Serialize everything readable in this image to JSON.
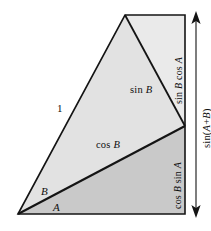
{
  "figure": {
    "name": "sine-addition-formula-geometric-proof",
    "width": 211,
    "height": 231,
    "background_color": "#ffffff",
    "stroke_color": "#141414",
    "colors": {
      "upper_triangle_fill": "#e2e2e2",
      "top_right_triangle_fill": "#eaeaea",
      "lower_region_fill": "#c9c9c9",
      "outline": "#141414",
      "arrow": "#141414",
      "text": "#0f0f0f"
    },
    "vertices": {
      "bottom_left": [
        18,
        214
      ],
      "apex": [
        125,
        15
      ],
      "top_right": [
        185,
        15
      ],
      "right_mid": [
        185,
        126
      ],
      "bottom_right": [
        185,
        214
      ]
    },
    "labels": {
      "hypotenuse": "1",
      "angle_upper": "B",
      "angle_lower": "A",
      "sin_b": "sin B",
      "cos_b": "cos B",
      "sin_b_cos_a": "sin B cos A",
      "cos_b_sin_a": "cos B sin A",
      "total_height": "sin(A+B)"
    },
    "label_parts": {
      "sin_b_fn": "sin",
      "sin_b_var": "B",
      "cos_b_fn": "cos",
      "cos_b_var": "B",
      "sin_b_cos_a_fn1": "sin",
      "sin_b_cos_a_var1": "B",
      "sin_b_cos_a_fn2": "cos",
      "sin_b_cos_a_var2": "A",
      "cos_b_sin_a_fn1": "cos",
      "cos_b_sin_a_var1": "B",
      "cos_b_sin_a_fn2": "sin",
      "cos_b_sin_a_var2": "A",
      "total_fn": "sin(",
      "total_var1": "A",
      "total_plus": "+",
      "total_var2": "B",
      "total_close": ")"
    },
    "dimension_arrow": {
      "name": "sin(A+B) height arrow",
      "x": 196,
      "y_top": 14,
      "y_bottom": 215,
      "double_headed": true
    }
  }
}
